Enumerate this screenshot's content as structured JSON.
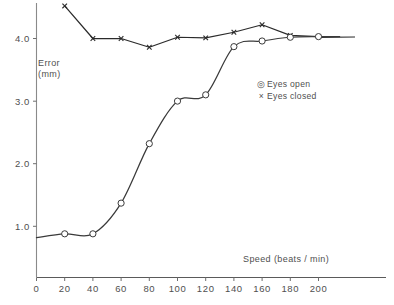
{
  "chart_data": {
    "type": "line",
    "title": "",
    "subtitle": "",
    "xlabel": "Speed  (beats / min)",
    "ylabel": "Error\n(mm)",
    "ylabel_lines": [
      "Error",
      "(mm)"
    ],
    "xlim": [
      0,
      215
    ],
    "ylim": [
      0,
      4.7
    ],
    "grid": false,
    "legend_position": "upper-right-inside",
    "x_ticks": [
      0,
      20,
      40,
      60,
      80,
      100,
      120,
      140,
      160,
      180,
      200
    ],
    "x_tick_labels": [
      "0",
      "20",
      "40",
      "60",
      "80",
      "100",
      "120",
      "140",
      "160",
      "180",
      "200"
    ],
    "y_ticks": [
      1.0,
      2.0,
      3.0,
      4.0
    ],
    "y_tick_labels": [
      "1.0",
      "2.0",
      "3.0",
      "4.0"
    ],
    "x": [
      20,
      40,
      60,
      80,
      100,
      120,
      140,
      160,
      180,
      200
    ],
    "series": [
      {
        "name": "Eyes open",
        "marker": "circle",
        "color": "#3a3a3a",
        "x": [
          20,
          40,
          60,
          80,
          100,
          120,
          140,
          160,
          180,
          200
        ],
        "values": [
          0.88,
          0.88,
          1.37,
          2.32,
          3.0,
          3.1,
          3.87,
          3.96,
          4.02,
          4.03
        ],
        "fit": "smooth-sigmoid"
      },
      {
        "name": "Eyes closed",
        "marker": "cross",
        "color": "#2b2b2b",
        "x": [
          20,
          40,
          60,
          80,
          100,
          120,
          140,
          160,
          180,
          200
        ],
        "values": [
          4.52,
          4.0,
          4.0,
          3.86,
          4.02,
          4.01,
          4.1,
          4.22,
          4.05,
          4.03
        ],
        "fit": "straight-segments"
      }
    ],
    "annotations": []
  },
  "legend": {
    "items": [
      {
        "marker": "circle-dot",
        "label": "Eyes open"
      },
      {
        "marker": "times",
        "label": "Eyes closed"
      }
    ]
  },
  "axes": {
    "y_title_line1": "Error",
    "y_title_line2": "(mm)",
    "x_title": "Speed  (beats / min)"
  }
}
